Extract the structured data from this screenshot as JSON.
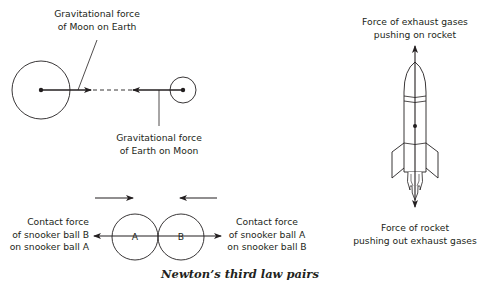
{
  "caption": "Newton’s third law pairs",
  "colors": {
    "ink": "#231f20",
    "background": "#ffffff"
  },
  "earth_moon": {
    "label_moon_on_earth": [
      "Gravitational force",
      "of Moon on Earth"
    ],
    "label_earth_on_moon": [
      "Gravitational force",
      "of Earth on Moon"
    ]
  },
  "snooker": {
    "ball_a_label": "A",
    "ball_b_label": "B",
    "label_left": [
      "Contact force",
      "of snooker ball B",
      "on snooker ball A"
    ],
    "label_right": [
      "Contact force",
      "of snooker ball A",
      "on snooker ball B"
    ]
  },
  "rocket": {
    "label_top": [
      "Force of exhaust gases",
      "pushing on rocket"
    ],
    "label_bottom": [
      "Force of rocket",
      "pushing out exhaust gases"
    ]
  }
}
